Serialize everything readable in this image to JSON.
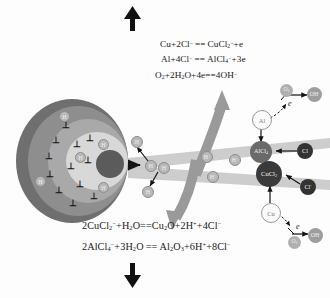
{
  "figure": {
    "background": "#fdfdfd"
  },
  "colors": {
    "outer_ring": "#6f6f6f",
    "mid_ring": "#8e8e8e",
    "inner_ring": "#a9a9a9",
    "pale_ring": "#d8d8d8",
    "core": "#5b5b5b",
    "band": "#c9c9c9",
    "curved_arrow": "#9a9a9a",
    "cucl2_fill": "#3a3a3a",
    "alcl4_fill": "#6a6a6a",
    "cl_fill": "#333333",
    "oh_fill": "#9e9e9e",
    "o2_fill": "#b0b0b0",
    "h_fill": "#b9b9b9",
    "text": "#1a1a1a"
  },
  "equations": {
    "top": [
      {
        "id": "eq-anodic-cu",
        "left": "Cu+2Cl",
        "left_sup": "-",
        "right": "CuCl",
        "right_sub": "2",
        "right_sup": "-",
        "tail": "+e"
      },
      {
        "id": "eq-anodic-al",
        "left": "Al+4Cl",
        "left_sup": "-",
        "right": "AlCl",
        "right_sub": "4",
        "right_sup": "-",
        "tail": "+3e"
      },
      {
        "id": "eq-cathodic-o2",
        "left": "O",
        "left_sub": "2",
        "mid": "+2H",
        "mid_sub": "2",
        "mid2": "O+4e",
        "right": "4OH",
        "right_sup": "-"
      }
    ],
    "bottom": [
      {
        "id": "eq-hydrolysis-cu",
        "text": "2CuCl2-+H2O = Cu2O+2H++4Cl-"
      },
      {
        "id": "eq-hydrolysis-al",
        "text": "2AlCl4-+3H2O = Al2O3+6H++8Cl-"
      }
    ]
  },
  "species": {
    "al_open": "Al",
    "cu_open": "Cu",
    "alcl4": "AlCl",
    "alcl4_sub": "4",
    "cucl2": "CuCl",
    "cucl2_sub": "2",
    "cl_upper": "Cl",
    "cl_lower": "Cl",
    "cl_sup": "-",
    "electron_upper": "e",
    "electron_lower": "e",
    "oh_upper": "OH",
    "oh_lower": "OH",
    "oh_sup": "-",
    "o2_upper": "O",
    "o2_lower": "O",
    "o2_sub": "2",
    "hydrogen": "H",
    "proton": "H",
    "proton_sup": "+"
  },
  "metal_sphere": {
    "label": "hydrogen enriched metal substrate",
    "dislocation_symbol": "⊥",
    "dislocation_count": 12,
    "hydrogen_label": "H",
    "hydrogen_count": 6
  },
  "arrows": {
    "top_direction": "up",
    "bottom_direction": "down",
    "stress_label": "applied tensile stress"
  }
}
